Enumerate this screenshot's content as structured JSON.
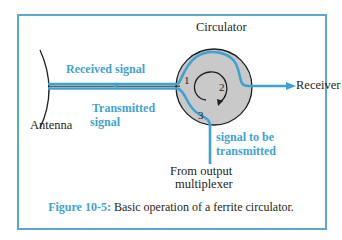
{
  "figure": {
    "title": "Basic operation of a ferrite circulator",
    "caption_label": "Figure 10-5:",
    "caption_text": " Basic operation of a ferrite circulator."
  },
  "labels": {
    "circulator": "Circulator",
    "antenna": "Antenna",
    "receiver": "Receiver",
    "received_signal": "Received signal",
    "transmitted_signal_line1": "Transmitted",
    "transmitted_signal_line2": "signal",
    "signal_to_be_line1": "signal to be",
    "signal_to_be_line2": "transmitted",
    "from_output_line1": "From output",
    "from_output_line2": "multiplexer"
  },
  "ports": {
    "p1": "1",
    "p2": "2",
    "p3": "3"
  },
  "colors": {
    "signal_blue": "#3fa3d1",
    "frame_blue": "#5aa9cc",
    "circulator_gray": "#c9c9c9",
    "ink": "#231f20"
  }
}
